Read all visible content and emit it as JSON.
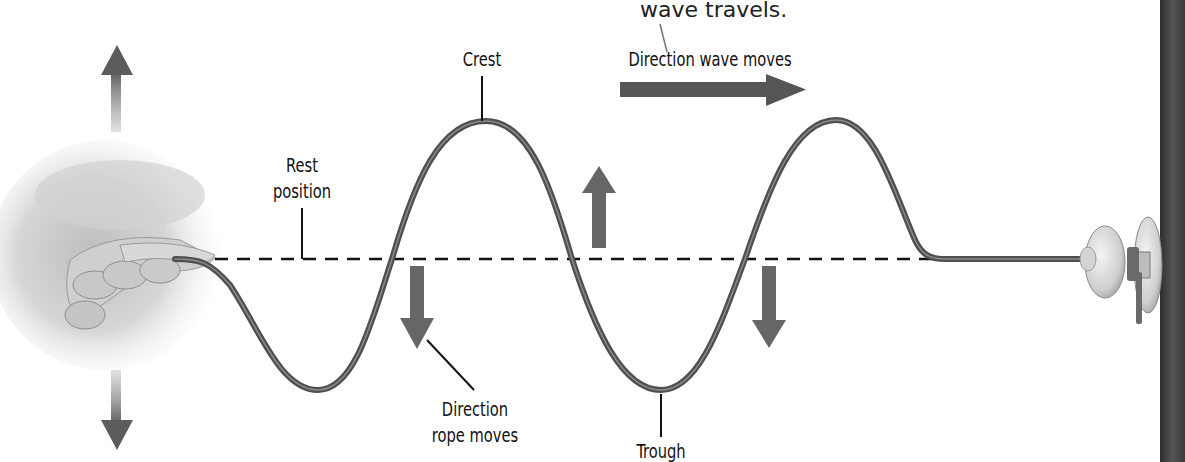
{
  "caption": {
    "text": "wave travels."
  },
  "labels": {
    "crest": "Crest",
    "trough": "Trough",
    "rest_line1": "Rest",
    "rest_line2": "position",
    "direction_wave": "Direction wave moves",
    "direction_rope_line1": "Direction",
    "direction_rope_line2": "rope moves"
  },
  "colors": {
    "rope": "#5a5a5a",
    "rope_highlight": "#9a9a9a",
    "arrow": "#6e6e6e",
    "arrow_dark": "#4a4a4a",
    "rest_line": "#111111",
    "wall": "#3a3a3a",
    "knob": "#d8d8d8"
  },
  "geometry": {
    "rest_y": 259,
    "crest_y": 121,
    "trough_y": 390,
    "crest_x": [
      486,
      836
    ],
    "trough_x": [
      318,
      661
    ]
  }
}
